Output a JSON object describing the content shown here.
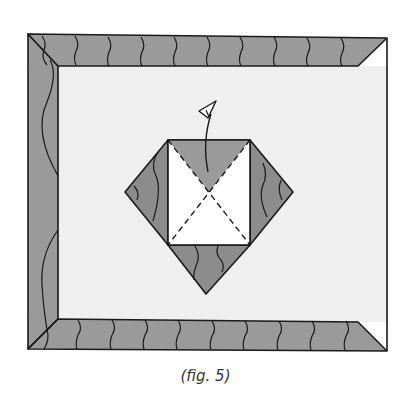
{
  "figure": {
    "type": "origami-folding-diagram",
    "caption": "(fig. 5)",
    "colors": {
      "paper_background": "#efefef",
      "colored_side": "#9a9a9a",
      "white_side": "#ffffff",
      "outline": "#1a1a1a",
      "page": "#ffffff"
    },
    "elements": [
      {
        "name": "outer-sheet",
        "description": "Large rectangle with folded colored borders on top, left and bottom edges"
      },
      {
        "name": "top-border",
        "description": "Folded top strip, colored side with wavy pattern, beveled right corner"
      },
      {
        "name": "left-border",
        "description": "Folded left strip, colored side with wavy pattern"
      },
      {
        "name": "bottom-border",
        "description": "Folded bottom strip, colored side with wavy pattern, beveled right corner"
      },
      {
        "name": "center-diamond",
        "description": "Diamond with white square center showing dashed diagonal fold lines"
      },
      {
        "name": "fold-arrow",
        "description": "Curved arrow indicating to fold the top triangle up and back"
      }
    ],
    "fold_lines": "dashed diagonals across center square"
  }
}
